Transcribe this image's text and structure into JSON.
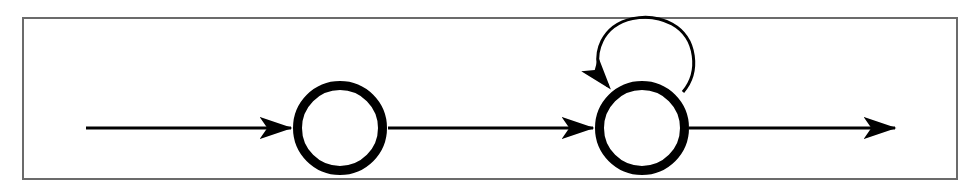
{
  "figure": {
    "canvas": {
      "width": 980,
      "height": 195
    },
    "background_color": "#ffffff",
    "ink_color": "#000000"
  },
  "frame": {
    "label": "figure-border",
    "x": 22,
    "y": 17,
    "width": 936,
    "height": 163,
    "stroke_color": "#6b6b6b",
    "stroke_width": 2,
    "fill_color": "#ffffff"
  },
  "chart_data": {
    "type": "diagram",
    "diagram_kind": "state-transition-graph",
    "node_count": 2,
    "edge_count": 4,
    "nodes": [
      {
        "id": "q0",
        "label": "",
        "shape": "circle",
        "cx": 340,
        "cy": 128,
        "outer_radius": 47,
        "inner_radius": 38,
        "stroke_width": 9,
        "stroke_color": "#000000",
        "fill_color": "#ffffff"
      },
      {
        "id": "q1",
        "label": "",
        "shape": "circle",
        "cx": 642,
        "cy": 128,
        "outer_radius": 47,
        "inner_radius": 38,
        "stroke_width": 9,
        "stroke_color": "#000000",
        "fill_color": "#ffffff"
      }
    ],
    "edges": [
      {
        "id": "start-to-q0",
        "label": "",
        "kind": "entry-arrow",
        "from": null,
        "to": "q0",
        "x1": 86,
        "y1": 128,
        "x2": 293,
        "y2": 128,
        "stroke_width": 3,
        "stroke_color": "#000000",
        "arrowhead": "end"
      },
      {
        "id": "q0-to-q1",
        "label": "",
        "kind": "transition-arrow",
        "from": "q0",
        "to": "q1",
        "x1": 388,
        "y1": 128,
        "x2": 595,
        "y2": 128,
        "stroke_width": 3,
        "stroke_color": "#000000",
        "arrowhead": "end"
      },
      {
        "id": "q1-self-loop",
        "label": "",
        "kind": "self-loop",
        "from": "q1",
        "to": "q1",
        "loop_cx": 645,
        "loop_cy": 61,
        "loop_radius": 45,
        "stroke_width": 3,
        "stroke_color": "#000000",
        "arrowhead": "end",
        "arrow_tip_x": 608,
        "arrow_tip_y": 90
      },
      {
        "id": "q1-to-accept",
        "label": "",
        "kind": "exit-arrow",
        "from": "q1",
        "to": null,
        "x1": 689,
        "y1": 128,
        "x2": 897,
        "y2": 128,
        "stroke_width": 3,
        "stroke_color": "#000000",
        "arrowhead": "end"
      }
    ],
    "annotations": [],
    "legend": null,
    "grid": false
  }
}
